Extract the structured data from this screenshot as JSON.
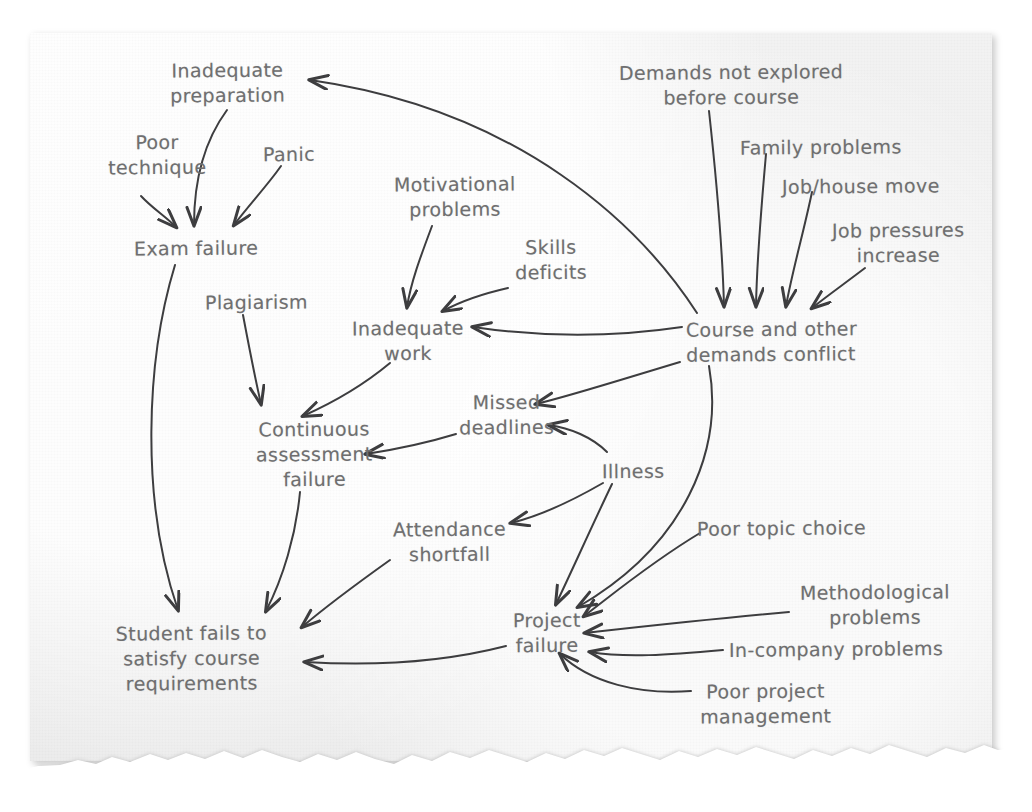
{
  "page": {
    "medium": "torn-paper-sheet",
    "paper_color": "#efefef",
    "page_background": "#ffffff",
    "ink_color": "#6f6f70",
    "arrow_color": "#3d3d3f",
    "style": "hand-drawn relations / causal diagram"
  },
  "diagram": {
    "type": "causal-relations-diagram",
    "nodes": [
      {
        "id": "inadequate-preparation",
        "label": "Inadequate\npreparation",
        "x": 170,
        "y": 58,
        "align": "center"
      },
      {
        "id": "poor-technique",
        "label": "Poor\ntechnique",
        "x": 108,
        "y": 130,
        "align": "center"
      },
      {
        "id": "panic",
        "label": "Panic",
        "x": 263,
        "y": 142,
        "align": "left"
      },
      {
        "id": "exam-failure",
        "label": "Exam failure",
        "x": 134,
        "y": 236,
        "align": "left"
      },
      {
        "id": "motivational-problems",
        "label": "Motivational\nproblems",
        "x": 394,
        "y": 172,
        "align": "center"
      },
      {
        "id": "skills-deficits",
        "label": "Skills\ndeficits",
        "x": 515,
        "y": 235,
        "align": "center"
      },
      {
        "id": "plagiarism",
        "label": "Plagiarism",
        "x": 205,
        "y": 290,
        "align": "left"
      },
      {
        "id": "inadequate-work",
        "label": "Inadequate\nwork",
        "x": 352,
        "y": 316,
        "align": "center"
      },
      {
        "id": "demands-not-explored",
        "label": "Demands not explored\nbefore course",
        "x": 619,
        "y": 60,
        "align": "center"
      },
      {
        "id": "family-problems",
        "label": "Family problems",
        "x": 740,
        "y": 135,
        "align": "left"
      },
      {
        "id": "job-house-move",
        "label": "Job/house move",
        "x": 782,
        "y": 174,
        "align": "left"
      },
      {
        "id": "job-pressures-increase",
        "label": "Job pressures\nincrease",
        "x": 832,
        "y": 218,
        "align": "center"
      },
      {
        "id": "course-demands-conflict",
        "label": "Course and other\ndemands conflict",
        "x": 686,
        "y": 317,
        "align": "left"
      },
      {
        "id": "continuous-assessment-failure",
        "label": "Continuous\nassessment\nfailure",
        "x": 256,
        "y": 417,
        "align": "center"
      },
      {
        "id": "missed-deadlines",
        "label": "Missed\ndeadlines",
        "x": 459,
        "y": 390,
        "align": "center"
      },
      {
        "id": "illness",
        "label": "Illness",
        "x": 602,
        "y": 459,
        "align": "left"
      },
      {
        "id": "attendance-shortfall",
        "label": "Attendance\nshortfall",
        "x": 393,
        "y": 517,
        "align": "center"
      },
      {
        "id": "poor-topic-choice",
        "label": "Poor topic choice",
        "x": 697,
        "y": 516,
        "align": "left"
      },
      {
        "id": "methodological-problems",
        "label": "Methodological\nproblems",
        "x": 800,
        "y": 580,
        "align": "center"
      },
      {
        "id": "project-failure",
        "label": "Project\nfailure",
        "x": 513,
        "y": 608,
        "align": "center"
      },
      {
        "id": "in-company-problems",
        "label": "In-company problems",
        "x": 729,
        "y": 637,
        "align": "left"
      },
      {
        "id": "student-fails",
        "label": "Student fails to\nsatisfy course\nrequirements",
        "x": 116,
        "y": 621,
        "align": "center"
      },
      {
        "id": "poor-project-management",
        "label": "Poor project\nmanagement",
        "x": 700,
        "y": 679,
        "align": "center"
      }
    ],
    "edges": [
      {
        "from": "poor-technique",
        "to": "exam-failure"
      },
      {
        "from": "inadequate-preparation",
        "to": "exam-failure"
      },
      {
        "from": "panic",
        "to": "exam-failure"
      },
      {
        "from": "course-demands-conflict",
        "to": "inadequate-preparation"
      },
      {
        "from": "demands-not-explored",
        "to": "course-demands-conflict"
      },
      {
        "from": "family-problems",
        "to": "course-demands-conflict"
      },
      {
        "from": "job-house-move",
        "to": "course-demands-conflict"
      },
      {
        "from": "job-pressures-increase",
        "to": "course-demands-conflict"
      },
      {
        "from": "motivational-problems",
        "to": "inadequate-work"
      },
      {
        "from": "skills-deficits",
        "to": "inadequate-work"
      },
      {
        "from": "course-demands-conflict",
        "to": "inadequate-work"
      },
      {
        "from": "plagiarism",
        "to": "continuous-assessment-failure"
      },
      {
        "from": "inadequate-work",
        "to": "continuous-assessment-failure"
      },
      {
        "from": "missed-deadlines",
        "to": "continuous-assessment-failure"
      },
      {
        "from": "course-demands-conflict",
        "to": "missed-deadlines"
      },
      {
        "from": "illness",
        "to": "missed-deadlines"
      },
      {
        "from": "illness",
        "to": "attendance-shortfall"
      },
      {
        "from": "illness",
        "to": "project-failure"
      },
      {
        "from": "course-demands-conflict",
        "to": "project-failure"
      },
      {
        "from": "poor-topic-choice",
        "to": "project-failure"
      },
      {
        "from": "methodological-problems",
        "to": "project-failure"
      },
      {
        "from": "in-company-problems",
        "to": "project-failure"
      },
      {
        "from": "poor-project-management",
        "to": "project-failure"
      },
      {
        "from": "exam-failure",
        "to": "student-fails"
      },
      {
        "from": "continuous-assessment-failure",
        "to": "student-fails"
      },
      {
        "from": "attendance-shortfall",
        "to": "student-fails"
      },
      {
        "from": "project-failure",
        "to": "student-fails"
      }
    ]
  }
}
